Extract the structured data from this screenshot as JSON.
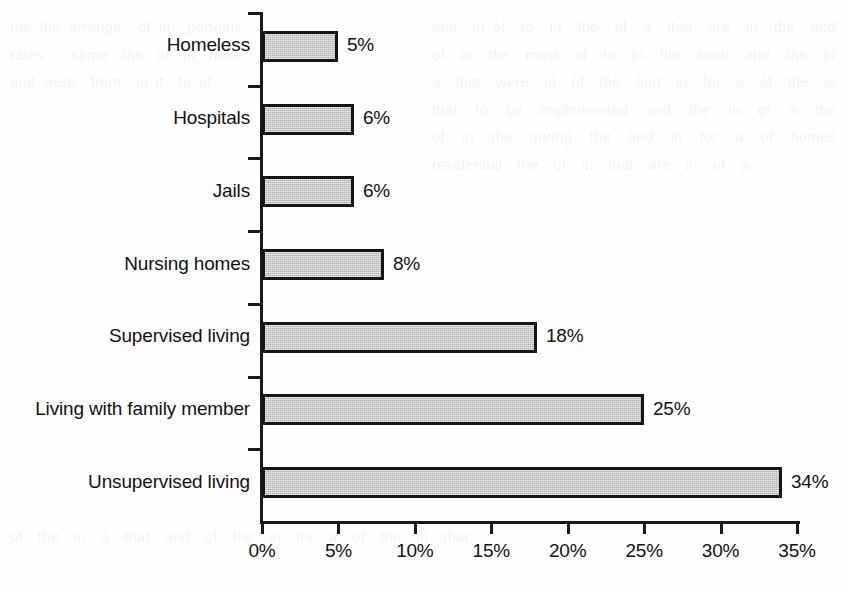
{
  "chart_data": {
    "type": "bar",
    "orientation": "horizontal",
    "title": "",
    "xlabel": "",
    "ylabel": "",
    "categories": [
      "Homeless",
      "Hospitals",
      "Jails",
      "Nursing homes",
      "Supervised living",
      "Living with family member",
      "Unsupervised living"
    ],
    "values": [
      5,
      6,
      6,
      8,
      18,
      25,
      34
    ],
    "value_labels": [
      "5%",
      "6%",
      "6%",
      "8%",
      "18%",
      "25%",
      "34%"
    ],
    "xlim": [
      0,
      35
    ],
    "xticks": [
      0,
      5,
      10,
      15,
      20,
      25,
      30,
      35
    ],
    "xtick_labels": [
      "0%",
      "5%",
      "10%",
      "15%",
      "20%",
      "25%",
      "30%",
      "35%"
    ],
    "grid": false,
    "legend": false,
    "bar_fill_color": "#c7c7c7",
    "bar_border_color": "#151515",
    "axis_color": "#1a1a1a",
    "background_color": "#fefefe"
  },
  "bleed_text": {
    "left": "the the arrange  of in  pertains rates  some the of in have  and were  from  in it  to of",
    "right": "and  in of  to  in  the  of  a  that  are  in  the  and  of  in  the  most  of  to  in  the  such  and  the  of  a  that  were  in  of  the  and  in  for  a  of  the  in  that  to  be  implemented  and  the  in  of  a  the  of  in  the  during  the  and  in  for  a  of  homes  residential  the  of  in  that  are  in  of  a",
    "bottom": "of  the  in  a  that  and  of  the  in  for  a  of  the  in  that"
  }
}
